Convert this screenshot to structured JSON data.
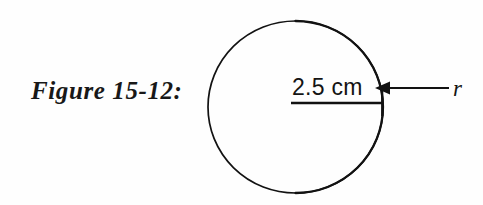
{
  "figure": {
    "caption": "Figure 15-12:",
    "dimension_label": "2.5 cm",
    "radius_symbol": "r",
    "shape": "circle",
    "stroke_color": "#111111",
    "background_color": "#fefefe",
    "icons": {
      "circle_outline": "circle-outline-icon",
      "radius_line": "radius-line-icon",
      "leader_arrow": "leader-arrow-icon"
    }
  },
  "geometry": {
    "circle_center_x": 295.5,
    "circle_center_y": 107,
    "circle_radius_x": 87.5,
    "circle_radius_y": 86,
    "radius_line_y": 103,
    "radius_line_x_start": 291,
    "radius_line_x_end": 383,
    "leader_y": 88,
    "leader_x_start": 383,
    "leader_x_end": 449,
    "arrow_tip_x": 379
  }
}
